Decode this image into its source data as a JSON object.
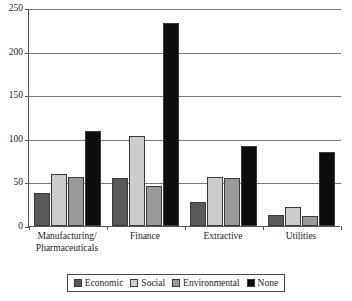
{
  "chart_data": {
    "type": "bar",
    "title": "",
    "subtitle": "",
    "xlabel": "",
    "ylabel": "",
    "ylim": [
      0,
      250
    ],
    "yticks": [
      0,
      50,
      100,
      150,
      200,
      250
    ],
    "grid": true,
    "legend_position": "bottom",
    "categories": [
      "Manufacturing/ Pharmaceuticals",
      "Finance",
      "Extractive",
      "Utilities"
    ],
    "category_lines": [
      [
        "Manufacturing/",
        "Pharmaceuticals"
      ],
      [
        "Finance",
        ""
      ],
      [
        "Extractive",
        ""
      ],
      [
        "Utilities",
        ""
      ]
    ],
    "series": [
      {
        "name": "Economic",
        "color": "#595959",
        "values": [
          38,
          55,
          28,
          13
        ]
      },
      {
        "name": "Social",
        "color": "#cccccc",
        "values": [
          60,
          103,
          56,
          22
        ]
      },
      {
        "name": "Environmental",
        "color": "#999999",
        "values": [
          56,
          46,
          55,
          11
        ]
      },
      {
        "name": "None",
        "color": "#0d0d0d",
        "values": [
          109,
          233,
          92,
          85
        ]
      }
    ]
  }
}
